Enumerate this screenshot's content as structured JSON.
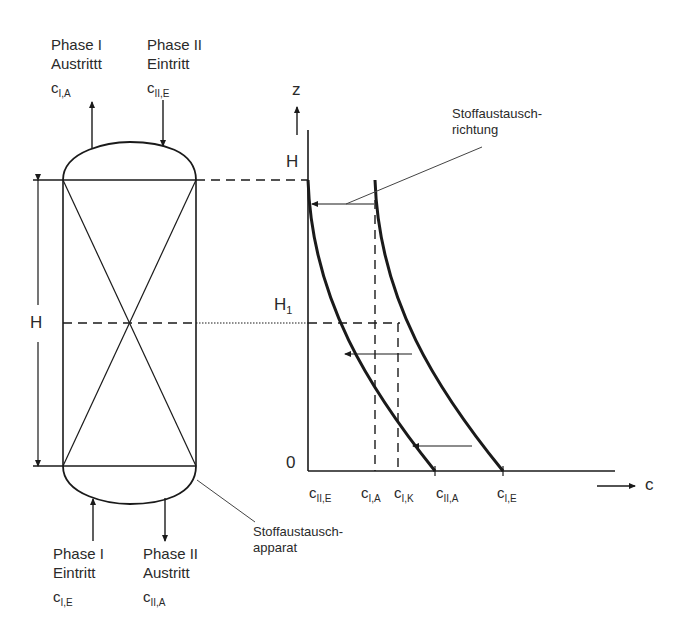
{
  "column": {
    "top_left": {
      "phase": "Phase I",
      "flow": "Austrittt",
      "conc_base": "c",
      "conc_sub": "I,A"
    },
    "top_right": {
      "phase": "Phase II",
      "flow": "Eintritt",
      "conc_base": "c",
      "conc_sub": "II,E"
    },
    "bottom_left": {
      "phase": "Phase I",
      "flow": "Eintritt",
      "conc_base": "c",
      "conc_sub": "I,E"
    },
    "bottom_right": {
      "phase": "Phase II",
      "flow": "Austritt",
      "conc_base": "c",
      "conc_sub": "II,A"
    },
    "height_label": "H",
    "apparatus_label_line1": "Stoffaustausch-",
    "apparatus_label_line2": "apparat"
  },
  "graph": {
    "z_axis_label": "z",
    "c_axis_label": "c",
    "tick_H": "H",
    "tick_H1_base": "H",
    "tick_H1_sub": "1",
    "tick_0": "0",
    "direction_label_line1": "Stoffaustausch-",
    "direction_label_line2": "richtung",
    "x_ticks": [
      {
        "base": "c",
        "sub": "II,E"
      },
      {
        "base": "c",
        "sub": "I,A"
      },
      {
        "base": "c",
        "sub": "I,K"
      },
      {
        "base": "c",
        "sub": "II,A"
      },
      {
        "base": "c",
        "sub": "I,E"
      }
    ]
  },
  "colors": {
    "line": "#1a1a1a",
    "background": "#ffffff"
  }
}
